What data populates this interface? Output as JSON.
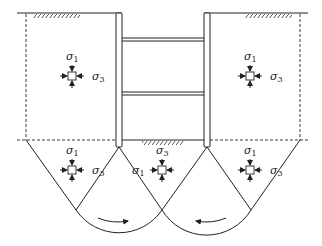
{
  "diagram": {
    "labels": {
      "sigma1": "σ",
      "sigma1_sub": "1",
      "sigma3": "σ",
      "sigma3_sub": "3"
    },
    "elements": [
      {
        "id": "left-active",
        "position": "behind left wall",
        "major": "σ1 vertical",
        "minor": "σ3 horizontal"
      },
      {
        "id": "right-active",
        "position": "behind right wall",
        "major": "σ1 vertical",
        "minor": "σ3 horizontal"
      },
      {
        "id": "left-below",
        "position": "below left, outside wall",
        "major": "σ1 vertical",
        "minor": "σ3 horizontal"
      },
      {
        "id": "center-passive",
        "position": "below excavation base",
        "major": "σ1 horizontal",
        "minor": "σ3 vertical"
      },
      {
        "id": "right-below",
        "position": "below right, outside wall",
        "major": "σ1 vertical",
        "minor": "σ3 horizontal"
      }
    ],
    "struts": 2,
    "rotation_arrows": [
      "clockwise (left)",
      "counter-clockwise (right)"
    ],
    "colors": {
      "line": "#222222",
      "background": "#ffffff"
    }
  }
}
